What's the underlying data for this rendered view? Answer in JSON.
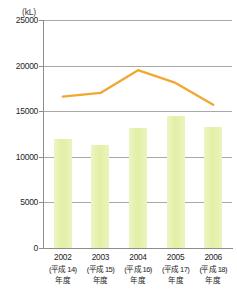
{
  "title": "",
  "unit_label": "(kL)",
  "chart_data": {
    "type": "bar",
    "title": "",
    "xlabel": "",
    "ylabel": "(kL)",
    "ylim": [
      0,
      25000
    ],
    "yticks": [
      0,
      5000,
      10000,
      15000,
      20000,
      25000
    ],
    "ytick_labels": [
      "0",
      "5000",
      "10000",
      "15000",
      "20000",
      "25000"
    ],
    "grid": true,
    "legend": "none",
    "categories": [
      "2002",
      "2003",
      "2004",
      "2005",
      "2006"
    ],
    "category_sub": [
      "(平成 14)",
      "(平成 15)",
      "(平成 16)",
      "(平成 17)",
      "(平成 18)"
    ],
    "category_suffix": [
      "年度",
      "年度",
      "年度",
      "年度",
      "年度"
    ],
    "series": [
      {
        "name": "bar-series",
        "type": "bar",
        "color": "#e2efa4",
        "values": [
          12000,
          11300,
          13200,
          14500,
          13300
        ]
      },
      {
        "name": "line-series",
        "type": "line",
        "color": "#f0a830",
        "values": [
          16600,
          17000,
          19500,
          18100,
          15700
        ]
      }
    ]
  },
  "axis": {
    "y_unit": "(kL)",
    "baseline_label": "0"
  }
}
